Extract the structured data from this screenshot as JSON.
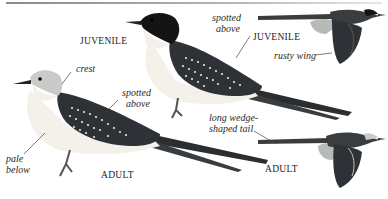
{
  "plate": {
    "labels": {
      "juvenile_perched": "JUVENILE",
      "juvenile_flight": "JUVENILE",
      "adult_perched": "ADULT",
      "adult_flight": "ADULT"
    },
    "annotations": {
      "crest": "crest",
      "spotted_above_adult_l1": "spotted",
      "spotted_above_adult_l2": "above",
      "spotted_above_juv_l1": "spotted",
      "spotted_above_juv_l2": "above",
      "pale_below_l1": "pale",
      "pale_below_l2": "below",
      "rusty_wing": "rusty wing",
      "long_tail_l1": "long wedge-",
      "long_tail_l2": "shaped tail"
    },
    "colors": {
      "background": "#ffffff",
      "wing_dark": "#2e3236",
      "spots": "#e8e4d8",
      "head_adult": "#c9cbc8",
      "cap_juvenile": "#141414",
      "belly": "#f3f1ea",
      "rusty": "#6a4a35"
    }
  }
}
